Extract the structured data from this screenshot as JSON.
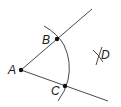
{
  "diagram": {
    "type": "geometric-construction",
    "points": [
      {
        "label": "A",
        "x": 21,
        "y": 70,
        "dot": true
      },
      {
        "label": "B",
        "x": 57,
        "y": 39,
        "dot": true
      },
      {
        "label": "C",
        "x": 65,
        "y": 86,
        "dot": true
      },
      {
        "label": "D",
        "x": 98,
        "y": 56,
        "dot": false
      }
    ],
    "rays": [
      {
        "from": "A",
        "through": "B",
        "end": [
          92,
          9
        ]
      },
      {
        "from": "A",
        "through": "C",
        "end": [
          108,
          101
        ]
      }
    ],
    "colors": {
      "stroke": "#333333",
      "text": "#1a1a1a",
      "background": "#ffffff"
    }
  }
}
